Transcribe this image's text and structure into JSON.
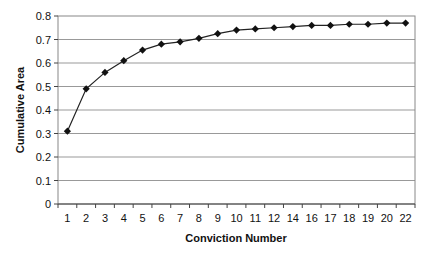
{
  "chart_data": {
    "type": "line",
    "title": "",
    "xlabel": "Conviction Number",
    "ylabel": "Cumulative Area",
    "categories": [
      "1",
      "2",
      "3",
      "4",
      "5",
      "6",
      "7",
      "8",
      "9",
      "10",
      "11",
      "12",
      "14",
      "16",
      "17",
      "18",
      "19",
      "20",
      "22"
    ],
    "series": [
      {
        "name": "Cumulative Area",
        "values": [
          0.31,
          0.49,
          0.56,
          0.61,
          0.655,
          0.68,
          0.69,
          0.705,
          0.725,
          0.74,
          0.745,
          0.75,
          0.755,
          0.76,
          0.76,
          0.765,
          0.765,
          0.77,
          0.77
        ],
        "marker": "diamond",
        "color": "#111111"
      }
    ],
    "ylim": [
      0,
      0.8
    ],
    "yticks": [
      "0",
      "0.1",
      "0.2",
      "0.3",
      "0.4",
      "0.5",
      "0.6",
      "0.7",
      "0.8"
    ],
    "grid": true,
    "legend": "none"
  }
}
